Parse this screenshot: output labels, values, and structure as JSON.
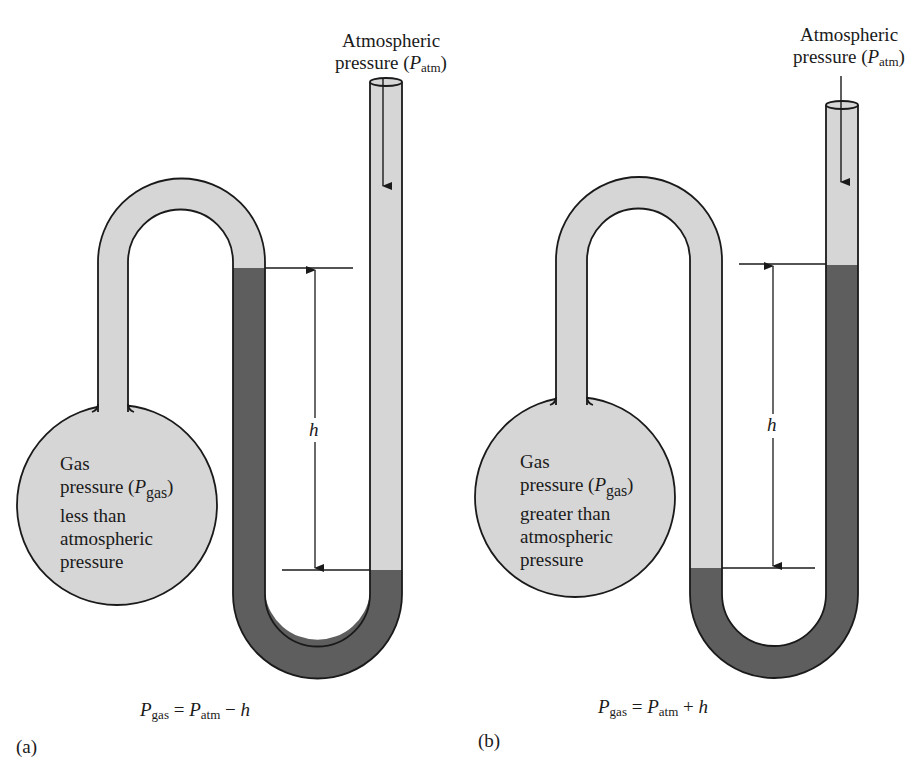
{
  "colors": {
    "background": "#ffffff",
    "gas_fill": "#d6d6d6",
    "liquid_fill": "#5e5e5e",
    "outline": "#1a1a1a"
  },
  "panels": [
    {
      "id": "a",
      "panel_label": "(a)",
      "atm_label": {
        "line1": "Atmospheric",
        "line2_pre": "pressure (",
        "symbol": "P",
        "subscript": "atm",
        "line2_post": ")"
      },
      "bulb_text": {
        "line1": "Gas",
        "line2_pre": "pressure (",
        "symbol": "P",
        "subscript": "gas",
        "line2_post": ")",
        "line3": "less than",
        "line4": "atmospheric",
        "line5": "pressure"
      },
      "height_label": "h",
      "equation": {
        "lhs_symbol": "P",
        "lhs_sub": "gas",
        "eq": " = ",
        "rhs_symbol": "P",
        "rhs_sub": "atm",
        "op": " − ",
        "var": "h"
      }
    },
    {
      "id": "b",
      "panel_label": "(b)",
      "atm_label": {
        "line1": "Atmospheric",
        "line2_pre": "pressure (",
        "symbol": "P",
        "subscript": "atm",
        "line2_post": ")"
      },
      "bulb_text": {
        "line1": "Gas",
        "line2_pre": "pressure (",
        "symbol": "P",
        "subscript": "gas",
        "line2_post": ")",
        "line3": "greater than",
        "line4": "atmospheric",
        "line5": "pressure"
      },
      "height_label": "h",
      "equation": {
        "lhs_symbol": "P",
        "lhs_sub": "gas",
        "eq": " = ",
        "rhs_symbol": "P",
        "rhs_sub": "atm",
        "op": " + ",
        "var": "h"
      }
    }
  ]
}
